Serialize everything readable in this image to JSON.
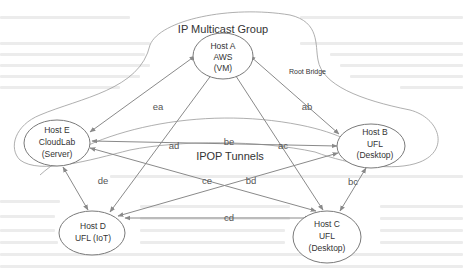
{
  "diagram": {
    "groups": {
      "multicast": {
        "label": "IP Multicast Group"
      },
      "ipop": {
        "label": "IPOP Tunnels"
      }
    },
    "root_bridge_label": "Root Bridge",
    "nodes": {
      "a": {
        "line1": "Host A",
        "line2": "AWS",
        "line3": "(VM)"
      },
      "b": {
        "line1": "Host B",
        "line2": "UFL",
        "line3": "(Desktop)"
      },
      "c": {
        "line1": "Host C",
        "line2": "UFL",
        "line3": "(Desktop)"
      },
      "d": {
        "line1": "Host D",
        "line2": "UFL (IoT)"
      },
      "e": {
        "line1": "Host E",
        "line2": "CloudLab",
        "line3": "(Server)"
      }
    },
    "edges": {
      "ea": "ea",
      "ab": "ab",
      "ad": "ad",
      "ac": "ac",
      "be": "be",
      "de": "de",
      "ce": "ce",
      "bd": "bd",
      "bc": "bc",
      "cd": "cd"
    },
    "colors": {
      "edge": "#8a8a8a",
      "node_stroke": "#7a7a7a",
      "text": "#333333"
    }
  }
}
